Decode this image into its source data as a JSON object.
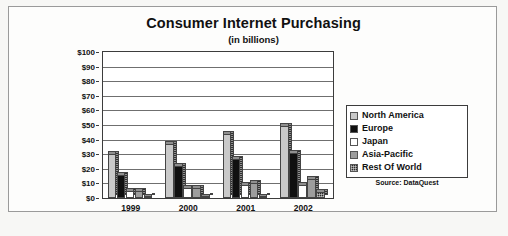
{
  "chart_data": {
    "type": "bar",
    "title": "Consumer Internet Purchasing",
    "subtitle": "(in billions)",
    "source": "Source: DataQuest",
    "xlabel": "",
    "ylabel": "",
    "categories": [
      "1999",
      "2000",
      "2001",
      "2002"
    ],
    "ylim": [
      0,
      100
    ],
    "ytick_values": [
      0,
      10,
      20,
      30,
      40,
      50,
      60,
      70,
      80,
      90,
      100
    ],
    "ytick_labels": [
      "$0",
      "$10",
      "$20",
      "$30",
      "$40",
      "$50",
      "$60",
      "$70",
      "$80",
      "$90",
      "$100"
    ],
    "grid": true,
    "legend_position": "right",
    "series": [
      {
        "name": "North America",
        "color": "#c9c9c9",
        "values": [
          30,
          37,
          44,
          49
        ]
      },
      {
        "name": "Europe",
        "color": "#101010",
        "values": [
          16,
          22,
          27,
          31
        ]
      },
      {
        "name": "Japan",
        "color": "#ffffff",
        "values": [
          5,
          7,
          9,
          9
        ]
      },
      {
        "name": "Asia-Pacific",
        "color": "#9d9d9d",
        "values": [
          5,
          7,
          10,
          13
        ]
      },
      {
        "name": "Rest Of World",
        "color": "#2a2a2a",
        "values": [
          1,
          1,
          1,
          4
        ]
      }
    ]
  }
}
